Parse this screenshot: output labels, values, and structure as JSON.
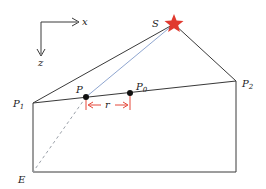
{
  "diagram": {
    "axes": {
      "x_label": "x",
      "z_label": "z"
    },
    "labels": {
      "source": "S",
      "p1": "P",
      "p1_sub": "1",
      "p2": "P",
      "p2_sub": "2",
      "p": "P",
      "p0": "P",
      "p0_sub": "0",
      "r": "r",
      "e": "E"
    },
    "colors": {
      "line": "#3a3a3a",
      "ray": "#8fa6d0",
      "dashed": "#9aa0a8",
      "star": "#e03a2f",
      "bracket": "#e5483a",
      "point": "#111111"
    }
  }
}
